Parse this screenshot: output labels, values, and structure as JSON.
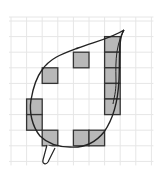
{
  "diagram": {
    "grid": {
      "origin_x": 11,
      "origin_y": 21,
      "cell": 15.6,
      "cols": 9,
      "rows": 9,
      "top_extent": 17,
      "line_color": "#e6e6e6"
    },
    "shaded_squares": [
      {
        "col": 6,
        "row": 1
      },
      {
        "col": 6,
        "row": 2
      },
      {
        "col": 6,
        "row": 3
      },
      {
        "col": 6,
        "row": 4
      },
      {
        "col": 6,
        "row": 5
      },
      {
        "col": 4,
        "row": 2
      },
      {
        "col": 2,
        "row": 3
      },
      {
        "col": 1,
        "row": 5
      },
      {
        "col": 1,
        "row": 6
      },
      {
        "col": 2,
        "row": 7
      },
      {
        "col": 4,
        "row": 7
      },
      {
        "col": 5,
        "row": 7
      }
    ],
    "colors": {
      "fill": "#b8b8b8",
      "square_stroke": "#333333",
      "outline": "#222222",
      "background": "#ffffff"
    },
    "leaf": {
      "outline_path": "M124,30 C118,38 120,60 119,80 C118,100 114,118 104,132 C96,142 84,148 70,147 C58,147 48,144 40,136 C32,126 29,112 31,100 C33,88 36,78 42,70 C50,58 62,54 78,48 C94,42 112,38 124,30 Z",
      "midrib_path": "M124,30 C114,48 116,70 116,82 C116,92 114,98 113,104",
      "stem_path": "M47,145 L43,160 C42,164 46,165 48,162 L55,148"
    }
  }
}
